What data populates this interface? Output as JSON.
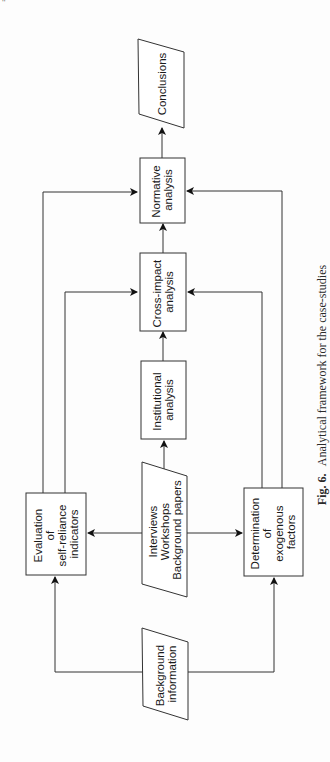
{
  "page": {
    "page_number_fragment": "''"
  },
  "figure": {
    "caption_label": "Fig. 6.",
    "caption_text": "Analytical framework for the case-studies",
    "orientation": "rotated-90-ccw"
  },
  "nodes": {
    "conclusions": {
      "shape": "parallelogram",
      "lines": [
        "Conclusions"
      ]
    },
    "normative": {
      "shape": "rectangle",
      "lines": [
        "Normative",
        "analysis"
      ]
    },
    "cross_impact": {
      "shape": "rectangle",
      "lines": [
        "Cross-impact",
        "analysis"
      ]
    },
    "institutional": {
      "shape": "rectangle",
      "lines": [
        "Institutional",
        "analysis"
      ]
    },
    "interviews": {
      "shape": "parallelogram",
      "lines": [
        "Interviews",
        "Workshops",
        "Background papers"
      ]
    },
    "evaluation": {
      "shape": "rectangle",
      "lines": [
        "Evaluation",
        "of",
        "self-reliance",
        "indicators"
      ]
    },
    "determination": {
      "shape": "rectangle",
      "lines": [
        "Determination",
        "of",
        "exogenous",
        "factors"
      ]
    },
    "background": {
      "shape": "parallelogram",
      "lines": [
        "Background",
        "information"
      ]
    }
  },
  "edges": [
    {
      "from": "background",
      "to": "evaluation"
    },
    {
      "from": "background",
      "to": "determination"
    },
    {
      "from": "interviews",
      "to": "evaluation"
    },
    {
      "from": "interviews",
      "to": "determination"
    },
    {
      "from": "interviews",
      "to": "institutional"
    },
    {
      "from": "institutional",
      "to": "cross_impact"
    },
    {
      "from": "evaluation",
      "to": "cross_impact"
    },
    {
      "from": "determination",
      "to": "cross_impact"
    },
    {
      "from": "cross_impact",
      "to": "normative"
    },
    {
      "from": "evaluation",
      "to": "normative"
    },
    {
      "from": "determination",
      "to": "normative"
    },
    {
      "from": "normative",
      "to": "conclusions"
    }
  ],
  "colors": {
    "stroke": "#333333",
    "text": "#1a1a1a",
    "background": "#fdfdfd"
  }
}
